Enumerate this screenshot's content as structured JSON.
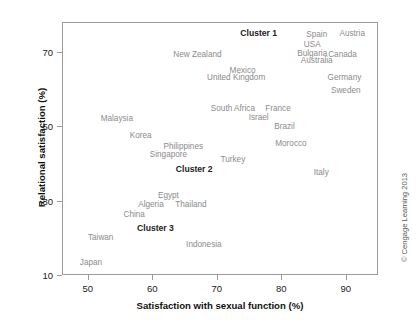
{
  "chart_data": {
    "type": "scatter",
    "title": "",
    "xlabel": "Satisfaction with sexual function (%)",
    "ylabel": "Relational satisfaction (%)",
    "xlim": [
      46,
      95
    ],
    "ylim": [
      10,
      78
    ],
    "xticks": [
      50,
      60,
      70,
      80,
      90
    ],
    "yticks": [
      10,
      30,
      50,
      70
    ],
    "xtick_labels": [
      "50",
      "60",
      "70",
      "80",
      "90"
    ],
    "ytick_labels": [
      "10",
      "30",
      "50",
      "70"
    ],
    "grid": false,
    "legend": "none",
    "markers_visible": false,
    "point_label_color": "#8b8b8b",
    "cluster_label_color": "#222222",
    "frame_color": "#9a9a9a",
    "points": [
      {
        "label": "Austria",
        "x": 91.0,
        "y": 75.0
      },
      {
        "label": "Spain",
        "x": 85.5,
        "y": 74.8
      },
      {
        "label": "USA",
        "x": 84.8,
        "y": 72.0
      },
      {
        "label": "Bulgaria",
        "x": 84.8,
        "y": 69.8
      },
      {
        "label": "Canada",
        "x": 89.5,
        "y": 69.5
      },
      {
        "label": "Australia",
        "x": 85.5,
        "y": 67.8
      },
      {
        "label": "New Zealand",
        "x": 67.0,
        "y": 69.3
      },
      {
        "label": "Mexico",
        "x": 74.0,
        "y": 65.2
      },
      {
        "label": "United Kingdom",
        "x": 73.0,
        "y": 63.3
      },
      {
        "label": "Germany",
        "x": 89.8,
        "y": 63.2
      },
      {
        "label": "Sweden",
        "x": 90.0,
        "y": 59.8
      },
      {
        "label": "France",
        "x": 79.5,
        "y": 55.0
      },
      {
        "label": "South Africa",
        "x": 72.5,
        "y": 54.8
      },
      {
        "label": "Israel",
        "x": 76.5,
        "y": 52.5
      },
      {
        "label": "Malaysia",
        "x": 54.5,
        "y": 52.2
      },
      {
        "label": "Brazil",
        "x": 80.5,
        "y": 50.0
      },
      {
        "label": "Korea",
        "x": 58.2,
        "y": 47.5
      },
      {
        "label": "Morocco",
        "x": 81.5,
        "y": 45.5
      },
      {
        "label": "Philippines",
        "x": 64.8,
        "y": 44.8
      },
      {
        "label": "Singapore",
        "x": 62.5,
        "y": 42.6
      },
      {
        "label": "Turkey",
        "x": 72.5,
        "y": 41.2
      },
      {
        "label": "Italy",
        "x": 86.2,
        "y": 37.8
      },
      {
        "label": "Egypt",
        "x": 62.5,
        "y": 31.5
      },
      {
        "label": "Thailand",
        "x": 66.0,
        "y": 29.0
      },
      {
        "label": "Algeria",
        "x": 59.8,
        "y": 29.0
      },
      {
        "label": "China",
        "x": 57.2,
        "y": 26.5
      },
      {
        "label": "Taiwan",
        "x": 52.0,
        "y": 20.2
      },
      {
        "label": "Indonesia",
        "x": 68.0,
        "y": 18.2
      },
      {
        "label": "Japan",
        "x": 50.5,
        "y": 13.5
      }
    ],
    "clusters": [
      {
        "label": "Cluster 1",
        "x": 76.5,
        "y": 75.0
      },
      {
        "label": "Cluster 2",
        "x": 66.5,
        "y": 38.5
      },
      {
        "label": "Cluster 3",
        "x": 60.5,
        "y": 22.5
      }
    ],
    "annotations": {
      "copyright": "© Cengage Learning 2013"
    }
  }
}
